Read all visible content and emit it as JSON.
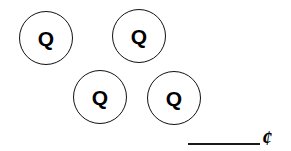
{
  "worksheet": {
    "type": "coin-counting-problem",
    "canvas": {
      "width": 291,
      "height": 151
    },
    "background_color": "#ffffff",
    "ink_color": "#000000"
  },
  "coins": [
    {
      "id": "coin-1",
      "label": "Q",
      "denomination_name": "quarter",
      "value_cents": 25,
      "center_x": 46,
      "center_y": 38,
      "diameter": 54
    },
    {
      "id": "coin-2",
      "label": "Q",
      "denomination_name": "quarter",
      "value_cents": 25,
      "center_x": 139,
      "center_y": 36,
      "diameter": 54
    },
    {
      "id": "coin-3",
      "label": "Q",
      "denomination_name": "quarter",
      "value_cents": 25,
      "center_x": 100,
      "center_y": 97,
      "diameter": 54
    },
    {
      "id": "coin-4",
      "label": "Q",
      "denomination_name": "quarter",
      "value_cents": 25,
      "center_x": 174,
      "center_y": 98,
      "diameter": 54
    }
  ],
  "answer": {
    "blank_value": "",
    "blank_placeholder": "",
    "currency_symbol": "¢",
    "currency_symbol_name": "cent-sign"
  }
}
